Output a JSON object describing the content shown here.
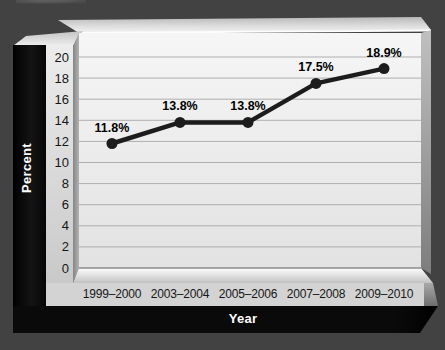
{
  "figure": {
    "y_axis_title": "Percent",
    "x_axis_title": "Year"
  },
  "chart_data": {
    "type": "line",
    "title": "",
    "categories": [
      "1999–2000",
      "2003–2004",
      "2005–2006",
      "2007–2008",
      "2009–2010"
    ],
    "values": [
      11.8,
      13.8,
      13.8,
      17.5,
      18.9
    ],
    "point_labels": [
      "11.8%",
      "13.8%",
      "13.8%",
      "17.5%",
      "18.9%"
    ],
    "xlabel": "Year",
    "ylabel": "Percent",
    "ylim": [
      0,
      20
    ],
    "ytick_step": 2,
    "ytick_labels": [
      "0",
      "2",
      "4",
      "6",
      "8",
      "10",
      "12",
      "14",
      "16",
      "18",
      "20"
    ],
    "grid": true,
    "legend": "none",
    "line_color": "#1c1c1c",
    "marker_color": "#1c1c1c",
    "gridline_color": "#aeaeae",
    "background_color": "#424242",
    "panel_color": "#0a0a0a"
  }
}
